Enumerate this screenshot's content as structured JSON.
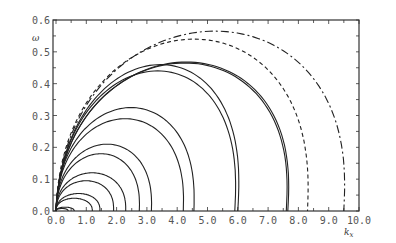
{
  "chart_data": {
    "type": "line",
    "title": "",
    "xlabel": "k_x",
    "ylabel": "ω",
    "xlim": [
      0.0,
      10.0
    ],
    "ylim": [
      0.0,
      0.6
    ],
    "grid": false,
    "legend": null,
    "x_ticks": [
      "0.0",
      "1.0",
      "2.0",
      "3.0",
      "4.0",
      "5.0",
      "6.0",
      "7.0",
      "8.0",
      "9.0",
      "10.0"
    ],
    "y_ticks": [
      "0.0",
      "0.1",
      "0.2",
      "0.3",
      "0.4",
      "0.5",
      "0.6"
    ],
    "series": [
      {
        "name": "curve-1a",
        "style": "solid",
        "kx_end": 0.4,
        "peak_kx": 0.2,
        "peak_omega": 0.008
      },
      {
        "name": "curve-1b",
        "style": "solid",
        "kx_end": 0.6,
        "peak_kx": 0.3,
        "peak_omega": 0.012
      },
      {
        "name": "curve-2a",
        "style": "solid",
        "kx_end": 1.2,
        "peak_kx": 0.6,
        "peak_omega": 0.04
      },
      {
        "name": "curve-2b",
        "style": "solid",
        "kx_end": 1.45,
        "peak_kx": 0.75,
        "peak_omega": 0.055
      },
      {
        "name": "curve-3a",
        "style": "solid",
        "kx_end": 1.9,
        "peak_kx": 1.0,
        "peak_omega": 0.095
      },
      {
        "name": "curve-3b",
        "style": "solid",
        "kx_end": 2.3,
        "peak_kx": 1.2,
        "peak_omega": 0.12
      },
      {
        "name": "curve-4a",
        "style": "solid",
        "kx_end": 2.75,
        "peak_kx": 1.5,
        "peak_omega": 0.18
      },
      {
        "name": "curve-4b",
        "style": "solid",
        "kx_end": 3.15,
        "peak_kx": 1.7,
        "peak_omega": 0.21
      },
      {
        "name": "curve-5a",
        "style": "solid",
        "kx_end": 4.2,
        "peak_kx": 2.3,
        "peak_omega": 0.29
      },
      {
        "name": "curve-5b",
        "style": "solid",
        "kx_end": 4.55,
        "peak_kx": 2.5,
        "peak_omega": 0.325
      },
      {
        "name": "curve-6a",
        "style": "solid",
        "kx_end": 5.9,
        "peak_kx": 3.4,
        "peak_omega": 0.44
      },
      {
        "name": "curve-6b",
        "style": "solid",
        "kx_end": 6.0,
        "peak_kx": 3.5,
        "peak_omega": 0.46
      },
      {
        "name": "curve-7a",
        "style": "solid",
        "kx_end": 7.6,
        "peak_kx": 4.3,
        "peak_omega": 0.465
      },
      {
        "name": "curve-7b",
        "style": "solid",
        "kx_end": 7.65,
        "peak_kx": 4.35,
        "peak_omega": 0.468
      },
      {
        "name": "curve-dashed",
        "style": "dashed",
        "kx_end": 8.3,
        "peak_kx": 4.6,
        "peak_omega": 0.54
      },
      {
        "name": "curve-dashdot",
        "style": "dashdot",
        "kx_end": 9.5,
        "peak_kx": 5.3,
        "peak_omega": 0.565
      }
    ]
  },
  "axes": {
    "x_label": "k",
    "x_label_sub": "x",
    "y_label": "ω"
  }
}
